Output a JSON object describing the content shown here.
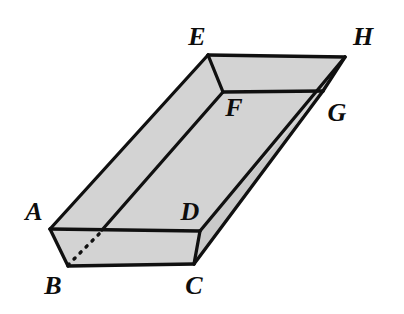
{
  "figure": {
    "type": "3d-solid-diagram",
    "canvas": {
      "width": 404,
      "height": 314
    },
    "style": {
      "background_color": "#ffffff",
      "face_fill_color": "#d3d3d3",
      "face_fill_color_dark": "#c6c6c6",
      "edge_color": "#101010",
      "hidden_edge_style": "dashed",
      "edge_width": 3.2,
      "label_color": "#0d0d0d"
    },
    "vertices": [
      {
        "id": "A",
        "label": "A",
        "x": 50,
        "y": 229,
        "label_x": 34,
        "label_y": 212,
        "hidden": false
      },
      {
        "id": "B",
        "label": "B",
        "x": 68,
        "y": 266,
        "label_x": 53,
        "label_y": 286,
        "hidden": false
      },
      {
        "id": "C",
        "label": "C",
        "x": 194,
        "y": 264,
        "label_x": 194,
        "label_y": 286,
        "hidden": false
      },
      {
        "id": "D",
        "label": "D",
        "x": 200,
        "y": 231,
        "label_x": 190,
        "label_y": 212,
        "hidden": false
      },
      {
        "id": "E",
        "label": "E",
        "x": 208,
        "y": 55,
        "label_x": 197,
        "label_y": 37,
        "hidden": false
      },
      {
        "id": "F",
        "label": "F",
        "x": 223,
        "y": 92,
        "label_x": 234,
        "label_y": 108,
        "hidden": false
      },
      {
        "id": "G",
        "label": "G",
        "x": 323,
        "y": 91,
        "label_x": 337,
        "label_y": 113,
        "hidden": false
      },
      {
        "id": "H",
        "label": "H",
        "x": 345,
        "y": 57,
        "label_x": 363,
        "label_y": 37,
        "hidden": false
      }
    ],
    "interior_points": [
      {
        "id": "J",
        "name": "hidden-edge-junction",
        "x": 102,
        "y": 230
      }
    ],
    "edges": [
      {
        "from": "A",
        "to": "D",
        "hidden": false
      },
      {
        "from": "A",
        "to": "B",
        "hidden": false
      },
      {
        "from": "B",
        "to": "C",
        "hidden": false
      },
      {
        "from": "C",
        "to": "D",
        "hidden": false
      },
      {
        "from": "A",
        "to": "E",
        "hidden": false
      },
      {
        "from": "D",
        "to": "H",
        "hidden": false
      },
      {
        "from": "C",
        "to": "G",
        "hidden": false
      },
      {
        "from": "E",
        "to": "H",
        "hidden": false
      },
      {
        "from": "E",
        "to": "F",
        "hidden": false
      },
      {
        "from": "F",
        "to": "G",
        "hidden": false
      },
      {
        "from": "G",
        "to": "H",
        "hidden": false
      },
      {
        "from": "F",
        "to": "J",
        "hidden": false
      },
      {
        "from": "B",
        "to": "J",
        "hidden": true
      }
    ],
    "faces": [
      {
        "name": "top-rim-left",
        "points": "50,229 208,55 223,92 102,230"
      },
      {
        "name": "top-rim-far",
        "points": "208,55 345,57 323,91 223,92"
      },
      {
        "name": "inner-floor",
        "points": "102,230 223,92 323,91 200,231"
      },
      {
        "name": "front-face",
        "points": "50,229 200,231 194,264 68,266"
      },
      {
        "name": "right-face",
        "points": "200,231 323,91 345,57 194,264"
      }
    ]
  }
}
